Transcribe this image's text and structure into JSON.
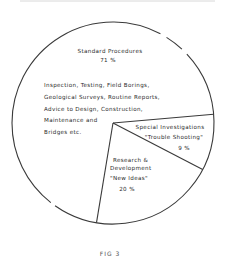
{
  "chart_data": {
    "type": "pie",
    "title": "",
    "caption": "FIG 3",
    "start_angle_deg": -5,
    "direction": "clockwise",
    "slices": [
      {
        "name": "Special Investigations",
        "sublabel": "\"Trouble Shooting\"",
        "value": 9,
        "value_label": "9 %"
      },
      {
        "name": "Research & Development",
        "name_lines": [
          "Research &",
          "Development"
        ],
        "sublabel": "\"New Ideas\"",
        "value": 20,
        "value_label": "20 %"
      },
      {
        "name": "Standard Procedures",
        "value": 71,
        "value_label": "71 %",
        "description_lines": [
          "Inspection, Testing, Field Borings,",
          "Geological Surveys, Routine Reports,",
          "Advice to Design, Construction,",
          "Maintenance and",
          "Bridges etc."
        ]
      }
    ],
    "unit": "%",
    "colors": {
      "stroke": "#3a3a3a",
      "fill": "#ffffff",
      "text": "#2a2a2a"
    }
  }
}
